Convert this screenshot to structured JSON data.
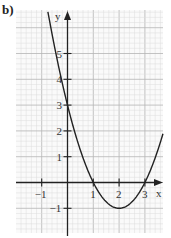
{
  "panel_label": "b)",
  "chart_data": {
    "type": "line",
    "title": "",
    "function": "y = x^2 - 4x + 3",
    "xlabel": "x",
    "ylabel": "y",
    "xlim": [
      -2,
      3.75
    ],
    "ylim": [
      -2,
      6.6
    ],
    "grid": true,
    "x_ticks": [
      -1,
      1,
      2,
      3
    ],
    "x_tick_labels": [
      "−1",
      "1",
      "2",
      "3"
    ],
    "y_ticks": [
      -1,
      1,
      2,
      3,
      4,
      5
    ],
    "y_tick_labels": [
      "−1",
      "1",
      "2",
      "3",
      "4",
      "5"
    ],
    "series": [
      {
        "name": "parabola",
        "x": [
          -0.75,
          -0.5,
          0,
          0.5,
          1,
          1.5,
          2,
          2.5,
          3,
          3.5,
          3.7
        ],
        "y": [
          6.56,
          5.25,
          3,
          1.25,
          0,
          -0.75,
          -1,
          -0.75,
          0,
          1.25,
          1.89
        ]
      }
    ],
    "key_points": {
      "y_intercept": [
        0,
        3
      ],
      "roots": [
        1,
        3
      ],
      "vertex": [
        2,
        -1
      ]
    },
    "colors": {
      "curve": "#222222",
      "axes": "#222222",
      "grid_minor": "#dddddd",
      "grid_major": "#b5b5b5"
    }
  }
}
